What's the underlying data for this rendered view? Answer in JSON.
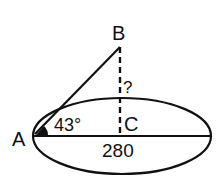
{
  "diagram": {
    "points": {
      "A": "A",
      "B": "B",
      "C": "C"
    },
    "angle_label": "43°",
    "base_label": "280",
    "unknown_label": "?",
    "colors": {
      "stroke": "#111111",
      "background": "#ffffff"
    }
  }
}
